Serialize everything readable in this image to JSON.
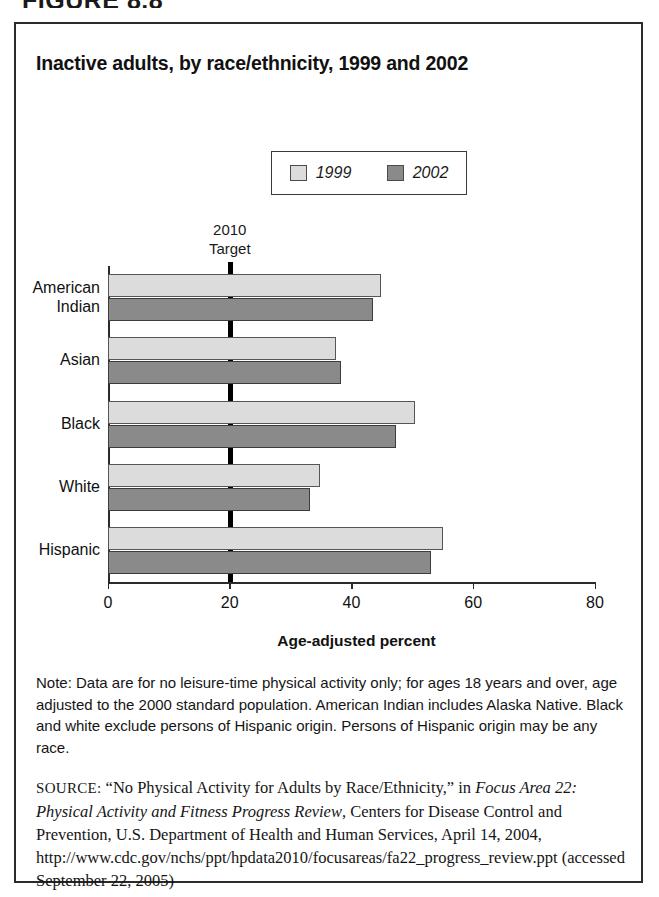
{
  "figure_caption": "FIGURE 8.8",
  "chart_title": "Inactive adults, by race/ethnicity, 1999 and 2002",
  "legend": {
    "items": [
      {
        "label": "1999",
        "color": "#dcdcdc"
      },
      {
        "label": "2002",
        "color": "#8a8a8a"
      }
    ]
  },
  "target": {
    "line1": "2010",
    "line2": "Target",
    "value": 20,
    "color": "#000000"
  },
  "axis": {
    "title": "Age-adjusted percent",
    "ticks": [
      "0",
      "20",
      "40",
      "60",
      "80"
    ]
  },
  "note": "Note: Data are for no leisure-time physical activity only; for ages 18 years and over, age adjusted to the 2000 standard population. American Indian includes Alaska Native. Black and white exclude persons of Hispanic origin. Persons of Hispanic origin may be any race.",
  "source": {
    "label": "SOURCE:",
    "text_1": "“No Physical Activity for Adults by Race/Ethnicity,” in ",
    "italic_1": "Focus Area 22: Physical Activity and Fitness Progress Review",
    "text_2": ", Centers for Disease Control and Prevention, U.S. Department of Health and Human Services, April 14, 2004, http://www.cdc.gov/nchs/ppt/hpdata2010/focusareas/fa22_progress_review.ppt (accessed September 22, 2005)"
  },
  "chart_data": {
    "type": "bar",
    "orientation": "horizontal",
    "title": "Inactive adults, by race/ethnicity, 1999 and 2002",
    "xlabel": "Age-adjusted percent",
    "ylabel": "",
    "xlim": [
      0,
      80
    ],
    "xticks": [
      0,
      20,
      40,
      60,
      80
    ],
    "grid": false,
    "legend_position": "top-center",
    "categories": [
      "American Indian",
      "Asian",
      "Black",
      "White",
      "Hispanic"
    ],
    "category_lines": [
      [
        "American",
        "Indian"
      ],
      [
        "Asian"
      ],
      [
        "Black"
      ],
      [
        "White"
      ],
      [
        "Hispanic"
      ]
    ],
    "series": [
      {
        "name": "1999",
        "color": "#dcdcdc",
        "values": [
          44.8,
          37.5,
          50.5,
          34.8,
          55.0
        ]
      },
      {
        "name": "2002",
        "color": "#8a8a8a",
        "values": [
          43.5,
          38.3,
          47.3,
          33.2,
          53.0
        ]
      }
    ],
    "reference_line": {
      "label": "2010 Target",
      "value": 20
    }
  }
}
